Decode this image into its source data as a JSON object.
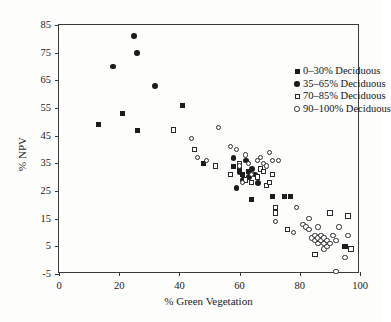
{
  "chart_data": {
    "type": "scatter",
    "title": "",
    "xlabel": "% Green Vegetation",
    "ylabel": "% NPV",
    "xlim": [
      0,
      100
    ],
    "ylim": [
      -5,
      85
    ],
    "grid": false,
    "legend_position": "top-right-inside",
    "xticks": [
      0,
      20,
      40,
      60,
      80,
      100
    ],
    "yticks": [
      -5,
      5,
      15,
      25,
      35,
      45,
      55,
      65,
      75,
      85
    ],
    "xtick_labels": [
      "0",
      "20",
      "40",
      "60",
      "80",
      "100"
    ],
    "ytick_labels": [
      "-5",
      "5",
      "15",
      "25",
      "35",
      "45",
      "55",
      "65",
      "75",
      "85"
    ],
    "series": [
      {
        "name": "0–30% Deciduous",
        "marker": "filled-square",
        "color": "#1c1c1c",
        "points": [
          [
            13,
            49
          ],
          [
            21,
            53
          ],
          [
            26,
            47
          ],
          [
            41,
            56
          ],
          [
            48,
            35
          ],
          [
            58,
            34
          ],
          [
            60,
            33
          ],
          [
            61,
            31
          ],
          [
            63,
            32
          ],
          [
            64,
            22
          ],
          [
            71,
            23
          ],
          [
            75,
            23
          ],
          [
            77,
            23
          ],
          [
            95,
            5
          ]
        ]
      },
      {
        "name": "35–65% Deciduous",
        "marker": "filled-circle",
        "color": "#1c1c1c",
        "points": [
          [
            18,
            70
          ],
          [
            25,
            81
          ],
          [
            26,
            75
          ],
          [
            32,
            63
          ],
          [
            58,
            37
          ],
          [
            60,
            32
          ],
          [
            61,
            29
          ],
          [
            62,
            36
          ],
          [
            63,
            30
          ],
          [
            64,
            33
          ],
          [
            65,
            31
          ],
          [
            59,
            26
          ],
          [
            66,
            28
          ]
        ]
      },
      {
        "name": "70–85% Deciduous",
        "marker": "open-square",
        "color": "#2a2a2a",
        "points": [
          [
            38,
            47
          ],
          [
            45,
            40
          ],
          [
            52,
            34
          ],
          [
            57,
            31
          ],
          [
            60,
            35
          ],
          [
            62,
            29
          ],
          [
            64,
            28
          ],
          [
            66,
            30
          ],
          [
            67,
            33
          ],
          [
            68,
            32
          ],
          [
            69,
            27
          ],
          [
            70,
            28
          ],
          [
            71,
            31
          ],
          [
            72,
            19
          ],
          [
            72,
            17
          ],
          [
            76,
            11
          ],
          [
            85,
            2
          ],
          [
            90,
            17
          ],
          [
            96,
            16
          ],
          [
            97,
            4
          ]
        ]
      },
      {
        "name": "90–100% Deciduous",
        "marker": "open-circle",
        "color": "#2a2a2a",
        "points": [
          [
            44,
            44
          ],
          [
            46,
            37
          ],
          [
            49,
            36
          ],
          [
            53,
            48
          ],
          [
            57,
            41
          ],
          [
            59,
            40
          ],
          [
            60,
            34
          ],
          [
            61,
            28
          ],
          [
            62,
            38
          ],
          [
            63,
            35
          ],
          [
            64,
            31
          ],
          [
            66,
            36
          ],
          [
            67,
            37
          ],
          [
            68,
            35
          ],
          [
            69,
            34
          ],
          [
            70,
            39
          ],
          [
            71,
            36
          ],
          [
            73,
            36
          ],
          [
            72,
            14
          ],
          [
            79,
            19
          ],
          [
            81,
            13
          ],
          [
            82,
            12
          ],
          [
            83,
            11
          ],
          [
            83,
            15
          ],
          [
            84,
            8
          ],
          [
            85,
            7
          ],
          [
            85,
            9
          ],
          [
            86,
            8
          ],
          [
            86,
            6
          ],
          [
            87,
            7
          ],
          [
            87,
            9
          ],
          [
            88,
            6
          ],
          [
            88,
            8
          ],
          [
            88,
            4
          ],
          [
            89,
            7
          ],
          [
            89,
            5
          ],
          [
            86,
            12
          ],
          [
            90,
            6
          ],
          [
            91,
            9
          ],
          [
            92,
            7
          ],
          [
            92,
            -4
          ],
          [
            93,
            12
          ],
          [
            95,
            1
          ],
          [
            96,
            9
          ],
          [
            78,
            10
          ]
        ]
      }
    ]
  },
  "legend": {
    "items": [
      {
        "label": "0–30% Deciduous",
        "marker": "filled-square"
      },
      {
        "label": "35–65% Deciduous",
        "marker": "filled-circle"
      },
      {
        "label": "70–85% Deciduous",
        "marker": "open-square"
      },
      {
        "label": "90–100% Deciduous",
        "marker": "open-circle"
      }
    ]
  }
}
